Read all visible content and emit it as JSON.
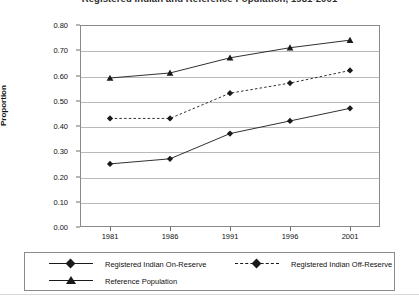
{
  "chart_data": {
    "type": "line",
    "title": "Registered Indian and Reference Population, 1981-2001",
    "title_visible_fragment": "Population, 1981-2001",
    "xlabel": "",
    "ylabel": "Proportion",
    "categories": [
      "1981",
      "1986",
      "1991",
      "1996",
      "2001"
    ],
    "x": [
      1981,
      1986,
      1991,
      1996,
      2001
    ],
    "ylim": [
      0.0,
      0.8
    ],
    "ytick_labels": [
      "0.00",
      "0.10",
      "0.20",
      "0.30",
      "0.40",
      "0.50",
      "0.60",
      "0.70",
      "0.80"
    ],
    "ytick_values": [
      0.0,
      0.1,
      0.2,
      0.3,
      0.4,
      0.5,
      0.6,
      0.7,
      0.8
    ],
    "grid": true,
    "grid_axis": "y",
    "legend_position": "bottom",
    "series": [
      {
        "name": "Registered Indian On-Reserve",
        "values": [
          0.25,
          0.27,
          0.37,
          0.42,
          0.47
        ],
        "marker": "diamond",
        "linestyle": "solid",
        "color": "#1a1a1a"
      },
      {
        "name": "Registered Indian Off-Reserve",
        "values": [
          0.43,
          0.43,
          0.53,
          0.57,
          0.62
        ],
        "marker": "diamond",
        "linestyle": "dashed",
        "color": "#1a1a1a"
      },
      {
        "name": "Reference Population",
        "values": [
          0.59,
          0.61,
          0.67,
          0.71,
          0.74
        ],
        "marker": "triangle",
        "linestyle": "solid",
        "color": "#1a1a1a"
      }
    ]
  },
  "legend": {
    "items": [
      {
        "label": "Registered Indian On-Reserve"
      },
      {
        "label": "Registered Indian Off-Reserve"
      },
      {
        "label": "Reference Population"
      }
    ]
  },
  "colors": {
    "ink": "#1a1a1a",
    "grid": "#b9b9b9",
    "frame": "#8a8a8a",
    "background": "#ffffff"
  }
}
